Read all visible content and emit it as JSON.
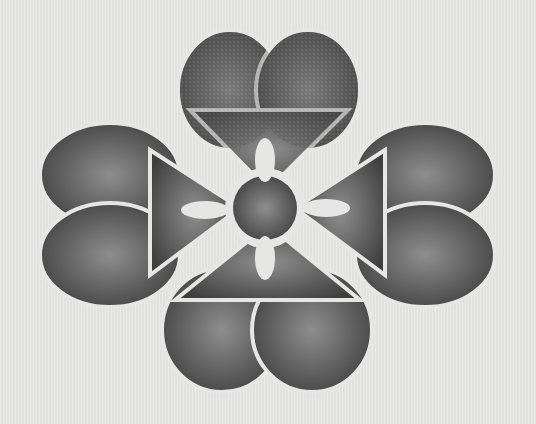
{
  "image": {
    "subject": "embroidered metallic flower motif",
    "background_color": "#e6e6e4",
    "motif_color_dark": "#4a4a4a",
    "motif_color_light": "#9a9a9a",
    "petals": 4,
    "lobes_per_petal": 2
  }
}
